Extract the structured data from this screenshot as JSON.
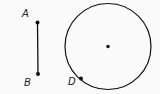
{
  "diagram": {
    "segment": {
      "start": {
        "label": "A",
        "x": 37.5,
        "y": 22.5
      },
      "end": {
        "label": "B",
        "x": 38,
        "y": 74
      }
    },
    "circle": {
      "center": {
        "x": 108,
        "y": 46.5
      },
      "radius": 43,
      "point_on_circle": {
        "label": "D",
        "x": 81,
        "y": 78.5
      }
    },
    "colors": {
      "stroke": "#111111",
      "background": "#fafafa"
    }
  }
}
